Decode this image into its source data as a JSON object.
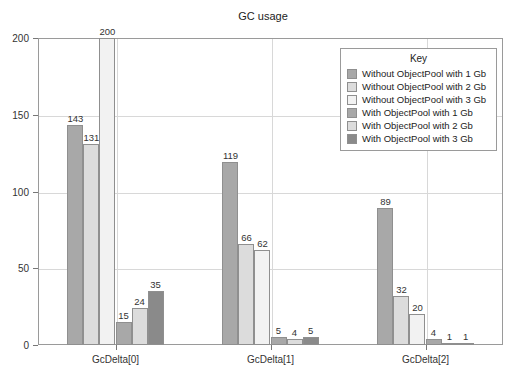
{
  "chart_data": {
    "type": "bar",
    "title": "GC usage",
    "xlabel": "",
    "ylabel": "",
    "ylim": [
      0,
      200
    ],
    "yticks": [
      0,
      50,
      100,
      150,
      200
    ],
    "grid": true,
    "legend_position": "inside-top-right",
    "legend_title": "Key",
    "categories": [
      "GcDelta[0]",
      "GcDelta[1]",
      "GcDelta[2]"
    ],
    "series": [
      {
        "name": "Without ObjectPool with 1 Gb",
        "color": "#a8a8a8",
        "values": [
          143,
          119,
          89
        ]
      },
      {
        "name": "Without ObjectPool with 2 Gb",
        "color": "#dcdcdc",
        "values": [
          131,
          66,
          32
        ]
      },
      {
        "name": "Without ObjectPool with 3 Gb",
        "color": "#f2f2f2",
        "values": [
          200,
          62,
          20
        ]
      },
      {
        "name": "With ObjectPool with 1 Gb",
        "color": "#a8a8a8",
        "values": [
          15,
          5,
          4
        ]
      },
      {
        "name": "With ObjectPool with 2 Gb",
        "color": "#dcdcdc",
        "values": [
          24,
          4,
          1
        ]
      },
      {
        "name": "With ObjectPool with 3 Gb",
        "color": "#8a8a8a",
        "values": [
          35,
          5,
          1
        ]
      }
    ]
  },
  "colors": {
    "frame": "#9a9a9a",
    "grid": "#d8d8d8",
    "text": "#222222",
    "background": "#ffffff"
  }
}
